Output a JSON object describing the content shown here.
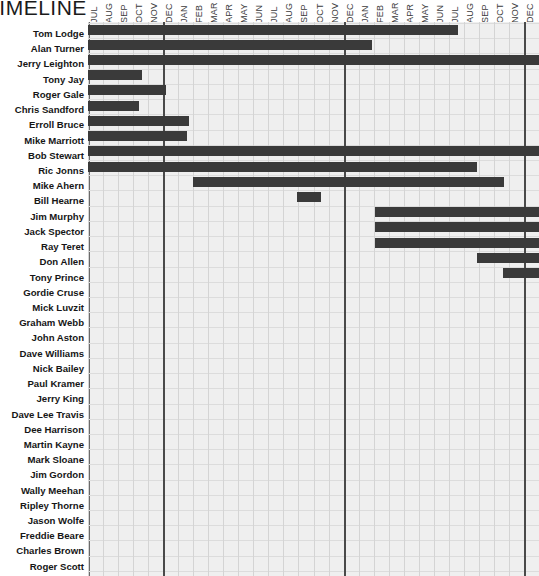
{
  "title": "TIMELINE",
  "chart_data": {
    "type": "bar",
    "orientation": "horizontal-gantt",
    "title": "TIMELINE",
    "xlabel": "",
    "ylabel": "",
    "grid": true,
    "legend": null,
    "x_axis": {
      "unit": "month",
      "tick_labels": [
        "JUL",
        "AUG",
        "SEP",
        "OCT",
        "NOV",
        "DEC",
        "JAN",
        "FEB",
        "MAR",
        "APR",
        "MAY",
        "JUN",
        "JUL",
        "AUG",
        "SEP",
        "OCT",
        "NOV",
        "DEC",
        "JAN",
        "FEB",
        "MAR",
        "APR",
        "MAY",
        "JUN",
        "JUL",
        "AUG",
        "SEP",
        "OCT",
        "NOV",
        "DEC"
      ],
      "visible_tick_labels": [
        "JUL",
        "AUG",
        "SEP",
        "OCT",
        "NOV",
        "DEC",
        "JAN",
        "FEB",
        "MAR",
        "APR",
        "MAY",
        "JUN",
        "JUL",
        "AUG",
        "SEP",
        "OCT",
        "NOV",
        "DEC"
      ],
      "major_divider_months": [
        "DEC",
        "DEC"
      ],
      "months_total": 30
    },
    "categories": [
      "Tom Lodge",
      "Alan Turner",
      "Jerry Leighton",
      "Tony Jay",
      "Roger Gale",
      "Chris Sandford",
      "Erroll Bruce",
      "Mike Marriott",
      "Bob Stewart",
      "Ric Jonns",
      "Mike Ahern",
      "Bill Hearne",
      "Jim Murphy",
      "Jack Spector",
      "Ray Teret",
      "Don Allen",
      "Tony Prince",
      "Gordie Cruse",
      "Mick Luvzit",
      "Graham Webb",
      "John Aston",
      "Dave Williams",
      "Nick Bailey",
      "Paul Kramer",
      "Jerry King",
      "Dave Lee Travis",
      "Dee Harrison",
      "Martin Kayne",
      "Mark Sloane",
      "Jim Gordon",
      "Wally Meehan",
      "Ripley Thorne",
      "Jason Wolfe",
      "Freddie Beare",
      "Charles Brown",
      "Roger Scott"
    ],
    "bars": [
      {
        "name": "Tom Lodge",
        "start_month": 0,
        "end_month": 24.6,
        "has_bar": true
      },
      {
        "name": "Alan Turner",
        "start_month": 0,
        "end_month": 18.9,
        "has_bar": true
      },
      {
        "name": "Jerry Leighton",
        "start_month": 0,
        "end_month": 30,
        "has_bar": true
      },
      {
        "name": "Tony Jay",
        "start_month": 0,
        "end_month": 3.6,
        "has_bar": true
      },
      {
        "name": "Roger Gale",
        "start_month": 0,
        "end_month": 5.2,
        "has_bar": true
      },
      {
        "name": "Chris Sandford",
        "start_month": 0,
        "end_month": 3.4,
        "has_bar": true
      },
      {
        "name": "Erroll Bruce",
        "start_month": 0,
        "end_month": 6.7,
        "has_bar": true
      },
      {
        "name": "Mike Marriott",
        "start_month": 0,
        "end_month": 6.6,
        "has_bar": true
      },
      {
        "name": "Bob Stewart",
        "start_month": 0,
        "end_month": 30,
        "has_bar": true
      },
      {
        "name": "Ric Jonns",
        "start_month": 0,
        "end_month": 25.9,
        "has_bar": true
      },
      {
        "name": "Mike Ahern",
        "start_month": 7.0,
        "end_month": 27.7,
        "has_bar": true
      },
      {
        "name": "Bill Hearne",
        "start_month": 13.9,
        "end_month": 15.5,
        "has_bar": true
      },
      {
        "name": "Jim Murphy",
        "start_month": 19.1,
        "end_month": 30,
        "has_bar": true
      },
      {
        "name": "Jack Spector",
        "start_month": 19.1,
        "end_month": 30,
        "has_bar": true
      },
      {
        "name": "Ray Teret",
        "start_month": 19.1,
        "end_month": 30,
        "has_bar": true
      },
      {
        "name": "Don Allen",
        "start_month": 25.9,
        "end_month": 30,
        "has_bar": true
      },
      {
        "name": "Tony Prince",
        "start_month": 27.6,
        "end_month": 30,
        "has_bar": true
      },
      {
        "name": "Gordie Cruse",
        "has_bar": false
      },
      {
        "name": "Mick Luvzit",
        "has_bar": false
      },
      {
        "name": "Graham Webb",
        "has_bar": false
      },
      {
        "name": "John Aston",
        "has_bar": false
      },
      {
        "name": "Dave Williams",
        "has_bar": false
      },
      {
        "name": "Nick Bailey",
        "has_bar": false
      },
      {
        "name": "Paul Kramer",
        "has_bar": false
      },
      {
        "name": "Jerry King",
        "has_bar": false
      },
      {
        "name": "Dave Lee Travis",
        "has_bar": false
      },
      {
        "name": "Dee Harrison",
        "has_bar": false
      },
      {
        "name": "Martin Kayne",
        "has_bar": false
      },
      {
        "name": "Mark Sloane",
        "has_bar": false
      },
      {
        "name": "Jim Gordon",
        "has_bar": false
      },
      {
        "name": "Wally Meehan",
        "has_bar": false
      },
      {
        "name": "Ripley Thorne",
        "has_bar": false
      },
      {
        "name": "Jason Wolfe",
        "has_bar": false
      },
      {
        "name": "Freddie Beare",
        "has_bar": false
      },
      {
        "name": "Charles Brown",
        "has_bar": false
      },
      {
        "name": "Roger Scott",
        "has_bar": false
      }
    ],
    "colors": {
      "bar": "#3a3a3a",
      "plot_background": "#efefef",
      "gridline": "#dcdcdc",
      "major_divider": "#4a4a4a",
      "text": "#161616"
    }
  }
}
